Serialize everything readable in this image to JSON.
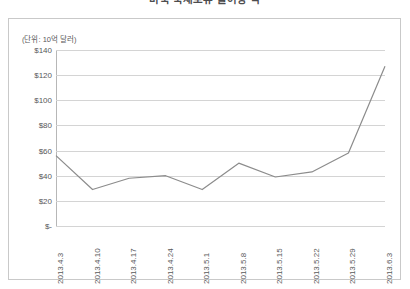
{
  "chart_title": "미국 국채보유 불어랑 액",
  "unit_label": "(단위: 10억 달러)",
  "chart_data": {
    "type": "line",
    "title": "미국 국채보유 불어랑 액",
    "subtitle": "(단위: 10억 달러)",
    "xlabel": "",
    "ylabel": "",
    "ylim": [
      0,
      140
    ],
    "ytick_labels": [
      "$140",
      "$120",
      "$100",
      "$80",
      "$60",
      "$40",
      "$20",
      "$-"
    ],
    "ytick_values": [
      140,
      120,
      100,
      80,
      60,
      40,
      20,
      0
    ],
    "grid": true,
    "legend": "none",
    "line_color": "#8c8c8c",
    "categories": [
      "2013.4.3",
      "2013.4.10",
      "2013.4.17",
      "2013.4.24",
      "2013.5.1",
      "2013.5.8",
      "2013.5.15",
      "2013.5.22",
      "2013.5.29",
      "2013.6.3"
    ],
    "values": [
      56,
      29,
      38,
      40,
      29,
      50,
      39,
      43,
      58,
      127
    ]
  }
}
